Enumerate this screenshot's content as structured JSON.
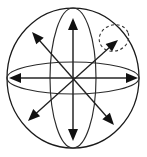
{
  "figure": {
    "kind": "line-drawing",
    "background_color": "#ffffff",
    "stroke_color": "#1a1a1a",
    "highlight_color": "#333333",
    "canvas": {
      "width": 147,
      "height": 157
    },
    "center": {
      "x": 73,
      "y": 78
    }
  },
  "sphere": {
    "name": "outer-sphere",
    "center_x": 73,
    "center_y": 78,
    "radius_x": 66,
    "radius_y": 70,
    "stroke": "#1a1a1a"
  },
  "orbits": [
    {
      "name": "equator-ellipse",
      "orientation": "horizontal",
      "center_x": 73,
      "center_y": 78,
      "radius_x": 66,
      "radius_y": 16,
      "stroke": "#2b2b2b"
    },
    {
      "name": "meridian-ellipse",
      "orientation": "vertical",
      "center_x": 73,
      "center_y": 78,
      "radius_x": 23,
      "radius_y": 70,
      "stroke": "#2b2b2b"
    }
  ],
  "arrows": [
    {
      "name": "vertical-axis-arrow",
      "label": "vertical double-headed arrow",
      "direction": "up-down",
      "x1": 73,
      "y1": 18,
      "x2": 73,
      "y2": 141,
      "heads": "both",
      "stroke": "#262626"
    },
    {
      "name": "horizontal-axis-arrow",
      "label": "horizontal double-headed arrow",
      "direction": "left-right",
      "x1": 9,
      "y1": 78,
      "x2": 138,
      "y2": 78,
      "heads": "both",
      "stroke": "#262626"
    },
    {
      "name": "diagonal-ne-sw-arrow",
      "label": "northeast-southwest double-headed arrow",
      "direction": "ne-sw",
      "x1": 118,
      "y1": 40,
      "x2": 28,
      "y2": 121,
      "heads": "both",
      "stroke": "#1f1f1f"
    },
    {
      "name": "diagonal-nw-se-arrow",
      "label": "northwest-southeast double-headed arrow",
      "direction": "nw-se",
      "x1": 32,
      "y1": 32,
      "x2": 114,
      "y2": 125,
      "heads": "both",
      "stroke": "#1f1f1f"
    }
  ],
  "highlight": {
    "name": "dashed-highlight-ring",
    "label": "dashed ellipse highlighting the northeast arrowhead",
    "center_x": 114,
    "center_y": 38,
    "radius_x": 15,
    "radius_y": 13,
    "rotation_deg": -20,
    "dash_pattern": "3 2.6",
    "stroke": "#333333"
  }
}
